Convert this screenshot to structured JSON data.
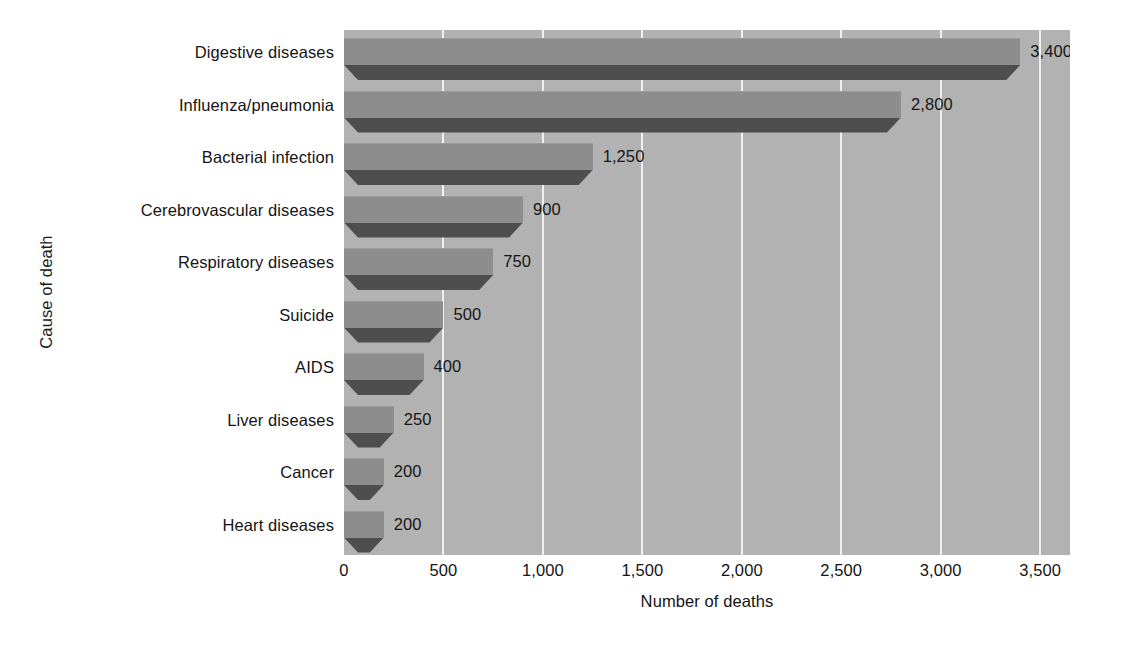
{
  "chart_data": {
    "type": "bar",
    "orientation": "horizontal",
    "title": "",
    "xlabel": "Number of deaths",
    "ylabel": "Cause of death",
    "categories": [
      "Digestive diseases",
      "Influenza/pneumonia",
      "Bacterial infection",
      "Cerebrovascular diseases",
      "Respiratory diseases",
      "Suicide",
      "AIDS",
      "Liver diseases",
      "Cancer",
      "Heart diseases"
    ],
    "values": [
      3400,
      2800,
      1250,
      900,
      750,
      500,
      400,
      250,
      200,
      200
    ],
    "data_labels": [
      "3,400",
      "2,800",
      "1,250",
      "900",
      "750",
      "500",
      "400",
      "250",
      "200",
      "200"
    ],
    "xlim": [
      0,
      3650
    ],
    "xticks": [
      0,
      500,
      1000,
      1500,
      2000,
      2500,
      3000,
      3500
    ],
    "xtick_labels": [
      "0",
      "500",
      "1,000",
      "1,500",
      "2,000",
      "2,500",
      "3,000",
      "3,500"
    ],
    "grid": true,
    "grid_axis": "x",
    "legend": "none",
    "style": "3d-horizontal-bars",
    "colors": {
      "plot_background": "#b2b2b2",
      "bar_face": "#8d8d8d",
      "bar_shadow": "#4e4e4e",
      "gridline": "#f0f0f0",
      "text": "#141414",
      "page_background": "#ffffff"
    }
  }
}
